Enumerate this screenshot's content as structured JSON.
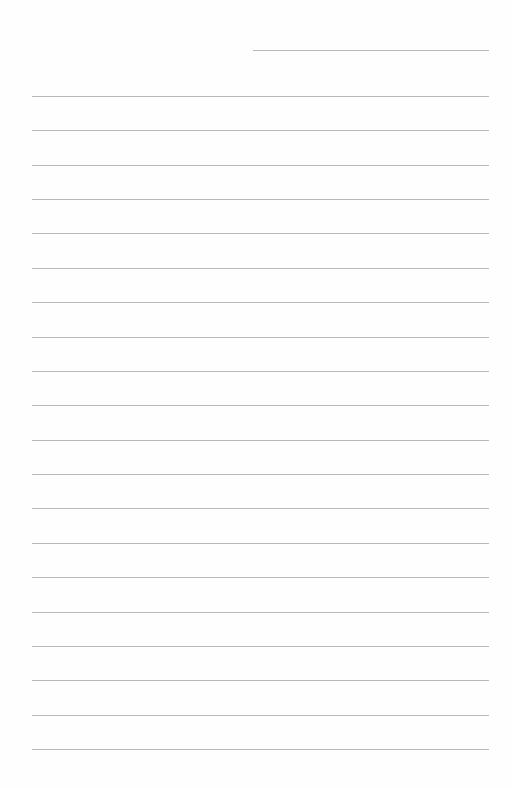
{
  "page": {
    "type": "lined-paper",
    "background_color": "#ffffff",
    "rule_color": "#b9b9b9",
    "header_line": {
      "label": "",
      "x": 253,
      "y": 50,
      "width": 236
    },
    "lines": {
      "count": 20,
      "start_y": 96,
      "spacing": 34.37,
      "x": 32,
      "width": 457
    },
    "text": []
  }
}
